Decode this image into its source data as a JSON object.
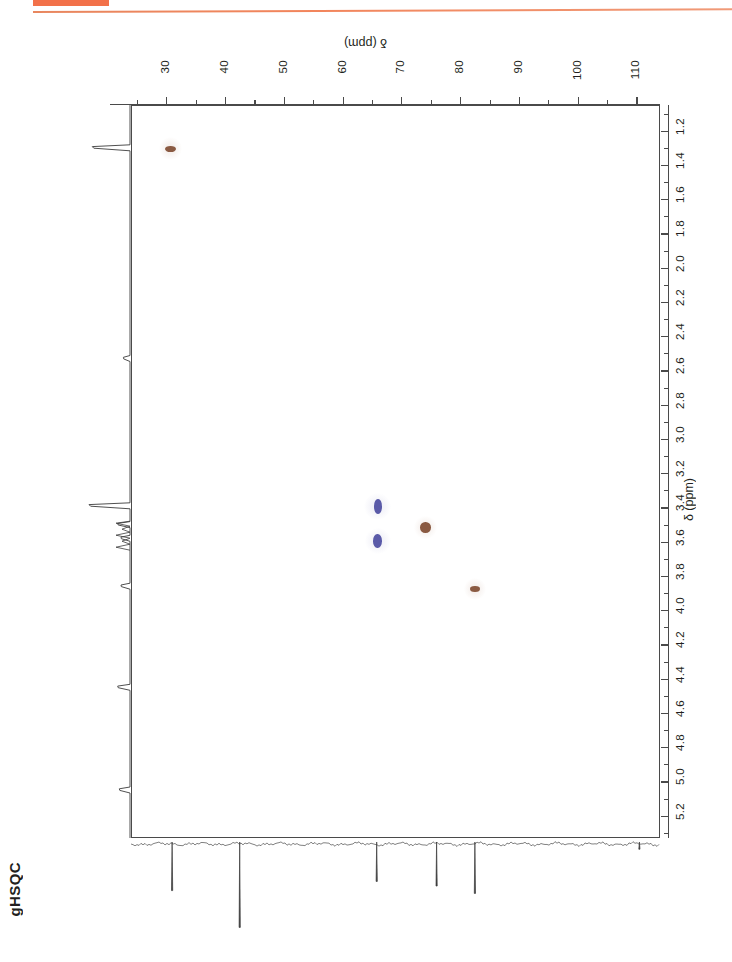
{
  "page": {
    "experiment_label": "gHSQC",
    "accent_color": "#f2714a",
    "positive_peak_color": "#8a5a42",
    "negative_peak_color": "#5a5aa8"
  },
  "axes": {
    "carbon": {
      "title": "δ (ppm)",
      "orientation": "top",
      "direction": "left-to-right-increasing",
      "min": 24,
      "max": 114,
      "major_ticks": [
        30,
        40,
        50,
        60,
        70,
        80,
        90,
        100,
        110
      ],
      "major_tick_labels": [
        "30",
        "40",
        "50",
        "60",
        "70",
        "80",
        "90",
        "100",
        "110"
      ],
      "minor_tick_step": 5
    },
    "proton": {
      "title": "δ (ppm)",
      "orientation": "right",
      "direction": "top-to-bottom-increasing",
      "min": 1.05,
      "max": 5.33,
      "major_ticks": [
        1.2,
        1.4,
        1.6,
        1.8,
        2.0,
        2.2,
        2.4,
        2.6,
        2.8,
        3.0,
        3.2,
        3.4,
        3.6,
        3.8,
        4.0,
        4.2,
        4.4,
        4.6,
        4.8,
        5.0,
        5.2
      ],
      "major_tick_labels": [
        "1.2",
        "1.4",
        "1.6",
        "1.8",
        "2.0",
        "2.2",
        "2.4",
        "2.6",
        "2.8",
        "3.0",
        "3.2",
        "3.4",
        "3.6",
        "3.8",
        "4.0",
        "4.2",
        "4.4",
        "4.6",
        "4.8",
        "5.0",
        "5.2"
      ],
      "minor_tick_step": 0.1
    }
  },
  "chart_data": {
    "type": "scatter",
    "title": "gHSQC",
    "xlabel": "δ (ppm)",
    "ylabel": "δ (ppm)",
    "xlim": [
      24,
      114
    ],
    "ylim": [
      1.05,
      5.33
    ],
    "grid": false,
    "legend": "none",
    "x_axis_position": "top",
    "y_axis_position": "right",
    "series": [
      {
        "name": "positive (CH / CH3)",
        "color": "#8a5a42",
        "phase": "positive",
        "points": [
          {
            "carbon_ppm": 30.5,
            "proton_ppm": 1.3,
            "w": 11,
            "h": 6
          },
          {
            "carbon_ppm": 74.0,
            "proton_ppm": 3.51,
            "w": 11,
            "h": 11
          },
          {
            "carbon_ppm": 82.3,
            "proton_ppm": 3.87,
            "w": 10,
            "h": 6
          }
        ]
      },
      {
        "name": "negative (CH2)",
        "color": "#5a5aa8",
        "phase": "negative",
        "points": [
          {
            "carbon_ppm": 65.8,
            "proton_ppm": 3.39,
            "w": 8,
            "h": 15
          },
          {
            "carbon_ppm": 65.8,
            "proton_ppm": 3.59,
            "w": 9,
            "h": 14
          }
        ]
      }
    ],
    "proton_projection_peaks": [
      {
        "ppm": 1.3,
        "height": 0.92
      },
      {
        "ppm": 2.53,
        "height": 0.16
      },
      {
        "ppm": 3.39,
        "height": 1.0
      },
      {
        "ppm": 3.5,
        "height": 0.3
      },
      {
        "ppm": 3.58,
        "height": 0.22
      },
      {
        "ppm": 3.86,
        "height": 0.22
      },
      {
        "ppm": 4.45,
        "height": 0.3
      },
      {
        "ppm": 5.05,
        "height": 0.26
      }
    ],
    "carbon_projection_peaks": [
      {
        "ppm": 31.0,
        "depth": 0.55
      },
      {
        "ppm": 42.5,
        "depth": 0.95
      },
      {
        "ppm": 65.8,
        "depth": 0.45
      },
      {
        "ppm": 76.0,
        "depth": 0.5
      },
      {
        "ppm": 82.5,
        "depth": 0.58
      },
      {
        "ppm": 110.5,
        "depth": 0.1
      }
    ]
  }
}
